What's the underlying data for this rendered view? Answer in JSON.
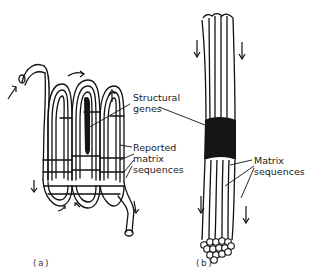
{
  "figure": {
    "panels": [
      {
        "id": "a",
        "label": "(a)",
        "description": "folded chromatin fiber with looped matrix sequences"
      },
      {
        "id": "b",
        "label": "(b)",
        "description": "straight bundle of fibers with central structural gene region"
      }
    ],
    "annotations": {
      "structural_genes": [
        "Structural",
        "genes"
      ],
      "reported_matrix": [
        "Reported",
        "matrix",
        "sequences"
      ],
      "matrix_sequences": [
        "Matrix",
        "sequences"
      ]
    },
    "colors": {
      "ink": "#111111",
      "background": "#ffffff",
      "structural_region": "#151515"
    }
  }
}
